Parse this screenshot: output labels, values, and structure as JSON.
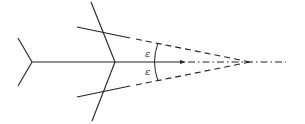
{
  "diagram": {
    "type": "arrow-fletching-angle-diagram",
    "labels": {
      "upper_angle": "ε",
      "lower_angle": "ε"
    },
    "colors": {
      "stroke": "#222222",
      "background": "#ffffff"
    }
  }
}
